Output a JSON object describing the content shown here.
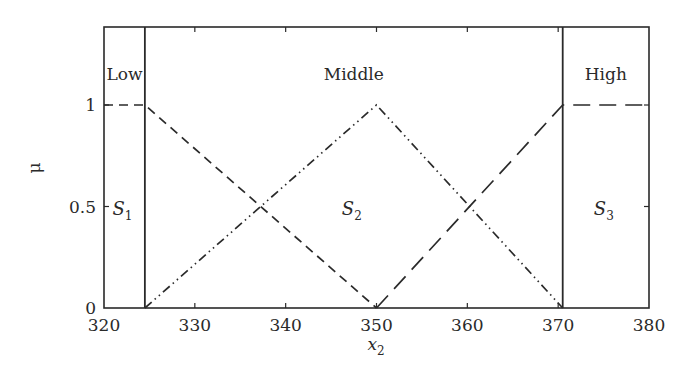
{
  "chart_data": {
    "type": "line",
    "title": "",
    "xlabel": "x",
    "xlabel_sub": "2",
    "ylabel": "μ",
    "xlim": [
      320,
      380
    ],
    "ylim": [
      0,
      1.35
    ],
    "x_ticks": [
      320,
      330,
      340,
      350,
      360,
      370,
      380
    ],
    "x_tick_labels": [
      "320",
      "330",
      "340",
      "350",
      "360",
      "370",
      "380"
    ],
    "y_ticks": [
      0,
      0.5,
      1
    ],
    "y_tick_labels": [
      "0",
      "0.5",
      "1"
    ],
    "grid": false,
    "legend": null,
    "boundaries": [
      324.5,
      370.5
    ],
    "regions": [
      {
        "name": "Low",
        "set_label": "S",
        "set_sub": "1",
        "x_range": [
          320,
          324.5
        ]
      },
      {
        "name": "Middle",
        "set_label": "S",
        "set_sub": "2",
        "x_range": [
          324.5,
          370.5
        ]
      },
      {
        "name": "High",
        "set_label": "S",
        "set_sub": "3",
        "x_range": [
          370.5,
          380
        ]
      }
    ],
    "series": [
      {
        "name": "Low membership",
        "style": "dashed",
        "x": [
          320,
          324.5,
          350
        ],
        "y": [
          1,
          1,
          0
        ]
      },
      {
        "name": "Middle membership",
        "style": "dash-dot-dot",
        "x": [
          324.5,
          350,
          370.5
        ],
        "y": [
          0,
          1,
          0
        ]
      },
      {
        "name": "High membership",
        "style": "long-dashed",
        "x": [
          350,
          370.5,
          380
        ],
        "y": [
          0,
          1,
          1
        ]
      }
    ]
  },
  "colors": {
    "line": "#2a2a2a",
    "background": "#ffffff"
  }
}
